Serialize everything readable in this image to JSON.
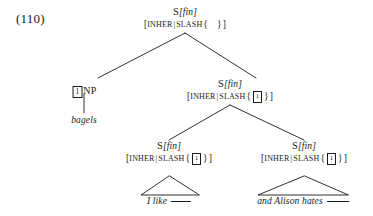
{
  "figure": {
    "example_number": "(110)",
    "type": "syntactic-tree",
    "notation": "HPSG SLASH feature tree"
  },
  "nodes": {
    "root": {
      "category": "S",
      "feature_bracket": "[fin]",
      "cat_label": "S[fin]",
      "feature_open": "[",
      "feature_name": "INHER",
      "feature_sep": "|",
      "feature_attr": "SLASH",
      "brace_open": "{",
      "set_value": "",
      "brace_close": "}",
      "feature_close": "]",
      "feature_label": "[INHER | SLASH { }]"
    },
    "np_filler": {
      "tag": "1",
      "label": "NP"
    },
    "bagels_leaf": {
      "text": "bagels"
    },
    "s_right": {
      "cat_label": "S[fin]",
      "category": "S",
      "feature_bracket": "[fin]",
      "feature_open": "[",
      "feature_name": "INHER",
      "feature_sep": "|",
      "feature_attr": "SLASH",
      "brace_open": "{",
      "tag": "1",
      "brace_close": "}",
      "feature_close": "]",
      "feature_label": "[INHER | SLASH { 1 }]"
    },
    "s_conj_left": {
      "cat_label": "S[fin]",
      "category": "S",
      "feature_bracket": "[fin]",
      "feature_open": "[",
      "feature_name": "INHER",
      "feature_sep": "|",
      "feature_attr": "SLASH",
      "brace_open": "{",
      "tag": "1",
      "brace_close": "}",
      "feature_close": "]",
      "feature_label": "[INHER | SLASH { 1 }]"
    },
    "s_conj_right": {
      "cat_label": "S[fin]",
      "category": "S",
      "feature_bracket": "[fin]",
      "feature_open": "[",
      "feature_name": "INHER",
      "feature_sep": "|",
      "feature_attr": "SLASH",
      "brace_open": "{",
      "tag": "1",
      "brace_close": "}",
      "feature_close": "]",
      "feature_label": "[INHER | SLASH { 1 }]"
    },
    "leaf_left": {
      "text": "I like",
      "gap": "___"
    },
    "leaf_right": {
      "text": "and Alison hates",
      "gap": "___"
    }
  },
  "colors": {
    "ink": "#1a1a1a",
    "background": "#ffffff"
  }
}
